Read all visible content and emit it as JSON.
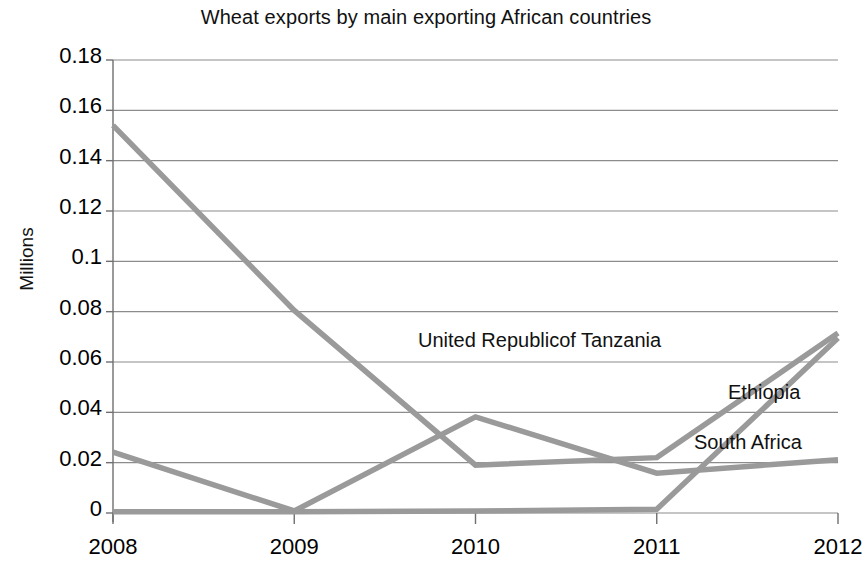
{
  "chart_data": {
    "type": "line",
    "title": "Wheat exports by main exporting African countries",
    "xlabel": "",
    "ylabel": "Millions",
    "categories": [
      "2008",
      "2009",
      "2010",
      "2011",
      "2012"
    ],
    "ylim": [
      0,
      0.18
    ],
    "yticks": [
      "0",
      "0.02",
      "0.04",
      "0.06",
      "0.08",
      "0.1",
      "0.12",
      "0.14",
      "0.16",
      "0.18"
    ],
    "ytick_values": [
      0,
      0.02,
      0.04,
      0.06,
      0.08,
      0.1,
      0.12,
      0.14,
      0.16,
      0.18
    ],
    "grid": true,
    "legend_position": "inline-labels",
    "series": [
      {
        "name": "United Republicof Tanzania",
        "values": [
          0.154,
          0.0805,
          0.019,
          0.022,
          0.0715
        ],
        "color": "#9a9a9a",
        "label_x": 418,
        "label_y": 329
      },
      {
        "name": "Ethiopia",
        "values": [
          0.0005,
          0.0005,
          0.0008,
          0.0015,
          0.0695
        ],
        "color": "#9a9a9a",
        "label_x": 728,
        "label_y": 381
      },
      {
        "name": "South Africa",
        "values": [
          0.0242,
          0.0008,
          0.0382,
          0.0158,
          0.0212
        ],
        "color": "#9a9a9a",
        "label_x": 694,
        "label_y": 431
      }
    ]
  },
  "axis": {
    "grid_color": "#8c8c8c",
    "axis_color": "#6f6f6f"
  }
}
